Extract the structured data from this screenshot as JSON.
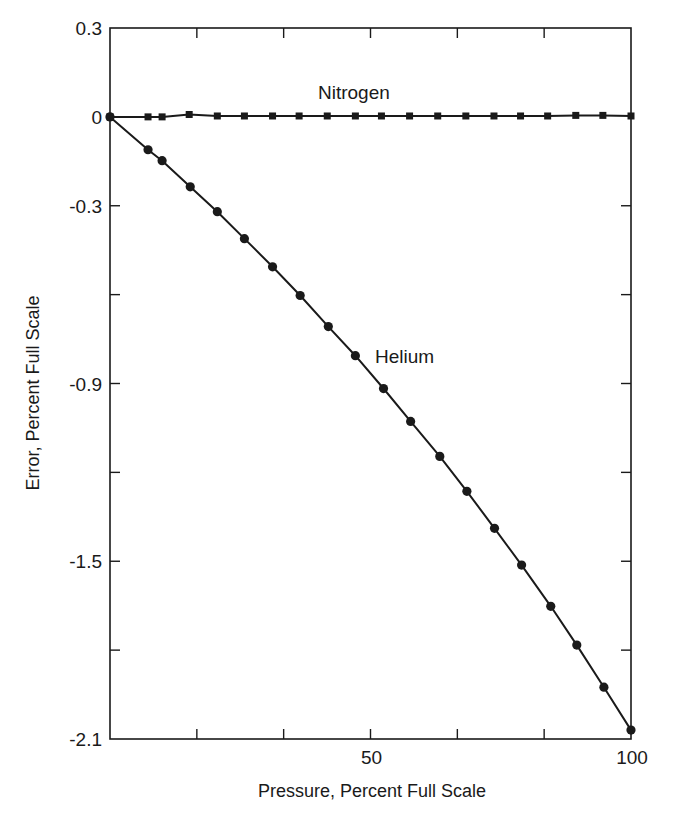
{
  "chart_data": {
    "type": "line",
    "title": "",
    "xlabel": "Pressure, Percent Full Scale",
    "ylabel": "Error, Percent Full Scale",
    "xlim": [
      0,
      100
    ],
    "ylim": [
      -2.1,
      0.3
    ],
    "grid": false,
    "legend": "none (series labeled inline)",
    "x_ticks": [
      0,
      16.67,
      33.33,
      50,
      66.67,
      83.33,
      100
    ],
    "x_tick_labels": [
      {
        "value": 50,
        "label": "50"
      },
      {
        "value": 100,
        "label": "100"
      }
    ],
    "y_ticks": [
      0.3,
      0,
      -0.3,
      -0.6,
      -0.9,
      -1.2,
      -1.5,
      -1.8,
      -2.1
    ],
    "y_tick_labels": [
      {
        "value": 0.3,
        "label": "0.3"
      },
      {
        "value": 0,
        "label": "0"
      },
      {
        "value": -0.3,
        "label": "-0.3"
      },
      {
        "value": -0.9,
        "label": "-0.9"
      },
      {
        "value": -1.5,
        "label": "-1.5"
      },
      {
        "value": -2.1,
        "label": "-2.1"
      }
    ],
    "series": [
      {
        "name": "Nitrogen",
        "marker": "square",
        "color": "#1a1a1a",
        "label_position": {
          "x": 40,
          "y": 0.09
        },
        "x": [
          0,
          7.3,
          10.0,
          15.2,
          20.6,
          25.8,
          31.2,
          36.3,
          41.7,
          47.1,
          52.1,
          57.5,
          62.9,
          68.3,
          73.7,
          78.8,
          84.0,
          89.4,
          94.6,
          100
        ],
        "values": [
          0,
          0,
          0,
          0.008,
          0.003,
          0.003,
          0.003,
          0.003,
          0.003,
          0.003,
          0.003,
          0.003,
          0.003,
          0.003,
          0.003,
          0.003,
          0.003,
          0.005,
          0.005,
          0.003
        ]
      },
      {
        "name": "Helium",
        "marker": "circle",
        "color": "#1a1a1a",
        "label_position": {
          "x": 51.5,
          "y": -0.8
        },
        "x": [
          0,
          7.3,
          10.0,
          15.4,
          20.6,
          25.8,
          31.2,
          36.5,
          41.9,
          47.1,
          52.5,
          57.7,
          63.3,
          68.5,
          73.8,
          79.0,
          84.6,
          89.6,
          94.8,
          100
        ],
        "values": [
          0,
          -0.111,
          -0.148,
          -0.236,
          -0.32,
          -0.411,
          -0.506,
          -0.603,
          -0.708,
          -0.806,
          -0.917,
          -1.028,
          -1.146,
          -1.264,
          -1.389,
          -1.513,
          -1.652,
          -1.783,
          -1.925,
          -2.07
        ]
      }
    ]
  },
  "labels": {
    "xlabel": "Pressure, Percent Full Scale",
    "ylabel": "Error, Percent Full Scale",
    "nitrogen": "Nitrogen",
    "helium": "Helium"
  }
}
